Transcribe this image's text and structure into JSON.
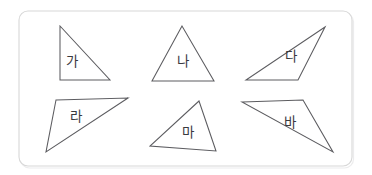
{
  "panel": {
    "name": "figure-panel",
    "x": 19,
    "y": 11,
    "width": 333,
    "height": 155,
    "rx": 9,
    "border_color": "#d8d8d8",
    "background_color": "#ffffff"
  },
  "canvas": {
    "width": 372,
    "height": 175,
    "background_color": "#ffffff"
  },
  "style": {
    "shape_stroke_color": "#5c5c60",
    "shape_fill_color": "#ffffff",
    "label_color": "#3a3a3e",
    "label_font_size": "13.5px"
  },
  "figures": [
    {
      "id": "triangle-ga",
      "label": "가",
      "shape": "right-triangle",
      "points": "60,26 60,80 110,80",
      "label_x": 72,
      "label_y": 62
    },
    {
      "id": "triangle-na",
      "label": "나",
      "shape": "isosceles-triangle",
      "points": "182,26 152,81 214,81",
      "label_x": 183,
      "label_y": 62
    },
    {
      "id": "triangle-da",
      "label": "다",
      "shape": "obtuse-triangle",
      "points": "325,27 246,80 298,80",
      "label_x": 291,
      "label_y": 57
    },
    {
      "id": "triangle-ra",
      "label": "라",
      "shape": "obtuse-triangle",
      "points": "56,100 128,98 46,152",
      "label_x": 76,
      "label_y": 117
    },
    {
      "id": "triangle-ma",
      "label": "마",
      "shape": "acute-triangle",
      "points": "199,101 150,146 216,151",
      "label_x": 188,
      "label_y": 133
    },
    {
      "id": "triangle-ba",
      "label": "바",
      "shape": "obtuse-triangle",
      "points": "242,102 303,100 333,152",
      "label_x": 290,
      "label_y": 123
    }
  ]
}
